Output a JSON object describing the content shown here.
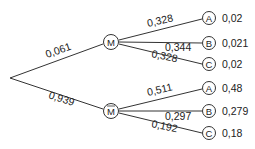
{
  "root": {
    "x": 10,
    "y": 78
  },
  "first_level": [
    {
      "id": "M",
      "label": "M",
      "overline": false,
      "x": 111,
      "y": 42,
      "edge_prob": "0,061",
      "children": [
        {
          "label": "A",
          "x": 209,
          "y": 18,
          "edge_prob": "0,328",
          "joint": "0,02"
        },
        {
          "label": "B",
          "x": 209,
          "y": 43,
          "edge_prob": "0,344",
          "joint": "0,021"
        },
        {
          "label": "C",
          "x": 209,
          "y": 64,
          "edge_prob": "0,328",
          "joint": "0,02"
        }
      ]
    },
    {
      "id": "Mbar",
      "label": "M",
      "overline": true,
      "x": 111,
      "y": 111,
      "edge_prob": "0,939",
      "children": [
        {
          "label": "A",
          "x": 209,
          "y": 88,
          "edge_prob": "0,511",
          "joint": "0,48"
        },
        {
          "label": "B",
          "x": 209,
          "y": 111,
          "edge_prob": "0,297",
          "joint": "0,279"
        },
        {
          "label": "C",
          "x": 209,
          "y": 133,
          "edge_prob": "0,192",
          "joint": "0,18"
        }
      ]
    }
  ]
}
